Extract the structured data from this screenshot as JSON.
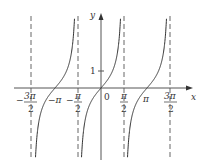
{
  "chart_data": {
    "type": "line",
    "title": "",
    "function": "y = tan x",
    "xlabel": "x",
    "ylabel": "y",
    "x_ticks": [
      {
        "num": "3π",
        "den": "2",
        "sign": "−",
        "value": -4.712
      },
      {
        "label": "−π",
        "value": -3.1416
      },
      {
        "num": "π",
        "den": "2",
        "sign": "−",
        "value": -1.5708
      },
      {
        "label": "0",
        "value": 0
      },
      {
        "num": "π",
        "den": "2",
        "sign": "",
        "value": 1.5708
      },
      {
        "label": "π",
        "value": 3.1416
      },
      {
        "num": "3π",
        "den": "2",
        "sign": "",
        "value": 4.712
      }
    ],
    "y_ticks": [
      {
        "label": "1",
        "value": 1
      }
    ],
    "asymptotes": [
      -4.712,
      -1.5708,
      1.5708,
      4.712
    ],
    "grid": false,
    "legend": null
  },
  "labels": {
    "x_axis": "x",
    "y_axis": "y",
    "origin": "0",
    "y_tick_1": "1",
    "neg_3pi_2_num": "3π",
    "neg_3pi_2_den": "2",
    "neg_pi": "−π",
    "neg_pi_2_num": "π",
    "neg_pi_2_den": "2",
    "pi_2_num": "π",
    "pi_2_den": "2",
    "pi": "π",
    "three_pi_2_num": "3π",
    "three_pi_2_den": "2",
    "minus": "−"
  }
}
